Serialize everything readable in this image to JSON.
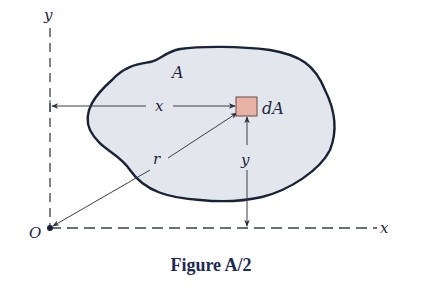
{
  "figure": {
    "caption": "Figure A/2",
    "labels": {
      "y_axis": "y",
      "x_axis": "x",
      "origin": "O",
      "area": "A",
      "element": "dA",
      "x_dist": "x",
      "y_dist": "y",
      "radius": "r"
    },
    "colors": {
      "region_fill": "#e3e7ed",
      "region_stroke": "#1a2236",
      "element_fill": "#e8b3a6",
      "element_stroke": "#6a4a46",
      "line": "#3a3f4a",
      "text": "#1d2540",
      "caption": "#1d2a52"
    }
  }
}
